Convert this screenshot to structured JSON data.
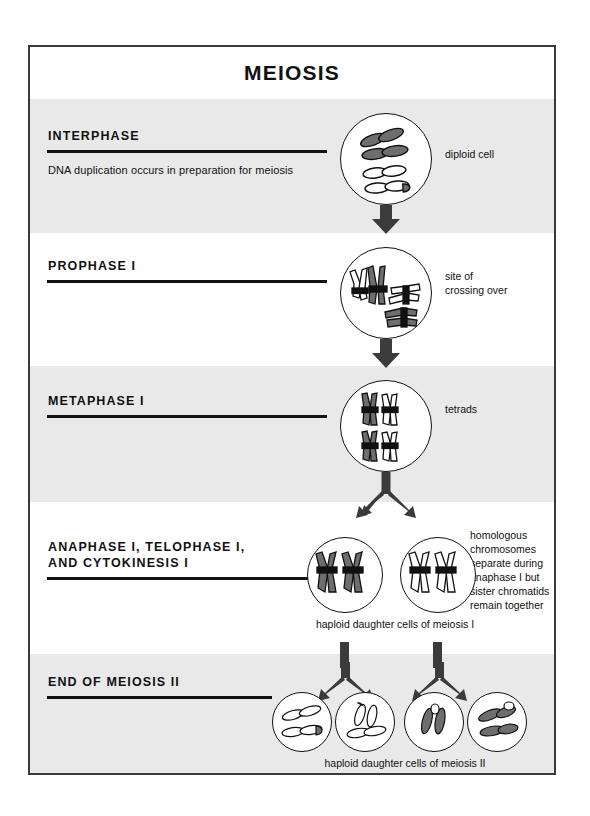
{
  "figure": {
    "title": "MEIOSIS",
    "type": "biology-process-diagram"
  },
  "sections": [
    {
      "heading": "INTERPHASE",
      "subtext": "DNA duplication occurs in preparation for meiosis",
      "side_label": "diploid cell",
      "caption": "",
      "cells": 1,
      "shaded": true
    },
    {
      "heading": "PROPHASE I",
      "subtext": "",
      "side_label": "site of\ncrossing over",
      "caption": "",
      "cells": 1,
      "shaded": false
    },
    {
      "heading": "METAPHASE I",
      "subtext": "",
      "side_label": "tetrads",
      "caption": "",
      "cells": 1,
      "shaded": true
    },
    {
      "heading": "ANAPHASE I, TELOPHASE I,\nAND CYTOKINESIS I",
      "subtext": "",
      "side_label": "homologous\nchromosomes\nseparate during\nanaphase I but\nsister chromatids\nremain together",
      "caption": "haploid daughter cells of meiosis I",
      "cells": 2,
      "shaded": false
    },
    {
      "heading": "END OF MEIOSIS II",
      "subtext": "",
      "side_label": "",
      "caption": "haploid daughter cells of meiosis II",
      "cells": 4,
      "shaded": true
    }
  ],
  "labels": {
    "interphase_heading": "INTERPHASE",
    "interphase_sub": "DNA duplication occurs in preparation for meiosis",
    "interphase_side": "diploid cell",
    "prophase_heading": "PROPHASE I",
    "prophase_side_1": "site of",
    "prophase_side_2": "crossing over",
    "metaphase_heading": "METAPHASE I",
    "metaphase_side": "tetrads",
    "anaphase_heading_1": "ANAPHASE I, TELOPHASE I,",
    "anaphase_heading_2": "AND CYTOKINESIS I",
    "anaphase_side_1": "homologous",
    "anaphase_side_2": "chromosomes",
    "anaphase_side_3": "separate during",
    "anaphase_side_4": "anaphase I but",
    "anaphase_side_5": "sister chromatids",
    "anaphase_side_6": "remain together",
    "anaphase_caption": "haploid daughter cells of meiosis I",
    "end_heading": "END OF MEIOSIS II",
    "end_caption": "haploid daughter cells of meiosis II"
  },
  "colors": {
    "frame": "#3a3a3a",
    "band_shaded": "#e9e9e9",
    "band_plain": "#ffffff",
    "ink": "#111111",
    "chromosome_dark": "#6e6e6e",
    "chromosome_light": "#ffffff",
    "centromere": "#111111",
    "arrow": "#3b3b3b"
  }
}
